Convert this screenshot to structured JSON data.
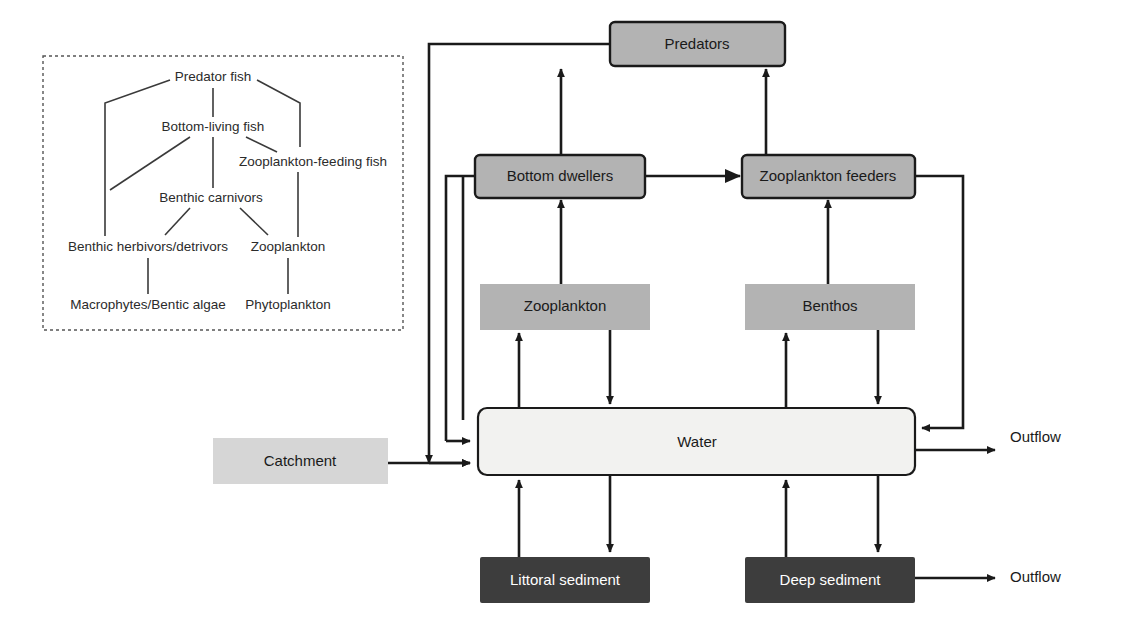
{
  "diagram": {
    "colors": {
      "box_mid_gray": "#b3b3b3",
      "box_light_gray": "#d6d6d6",
      "box_dark_gray": "#3d3d3d",
      "box_water_fill": "#f2f2f0",
      "stroke": "#1a1a1a",
      "inset_border": "#555555",
      "text_dark": "#1a1a1a",
      "text_light": "#ffffff"
    },
    "boxes": [
      {
        "id": "predators",
        "label": "Predators",
        "style": "mid-gray-bordered"
      },
      {
        "id": "bottom-dwellers",
        "label": "Bottom dwellers",
        "style": "mid-gray-bordered"
      },
      {
        "id": "zooplankton-feeders",
        "label": "Zooplankton feeders",
        "style": "mid-gray-bordered"
      },
      {
        "id": "zooplankton",
        "label": "Zooplankton",
        "style": "mid-gray-plain"
      },
      {
        "id": "benthos",
        "label": "Benthos",
        "style": "mid-gray-plain"
      },
      {
        "id": "water",
        "label": "Water",
        "style": "water"
      },
      {
        "id": "catchment",
        "label": "Catchment",
        "style": "light-gray-plain"
      },
      {
        "id": "littoral-sediment",
        "label": "Littoral sediment",
        "style": "dark-gray"
      },
      {
        "id": "deep-sediment",
        "label": "Deep sediment",
        "style": "dark-gray"
      }
    ],
    "outflows": [
      {
        "id": "outflow-water",
        "label": "Outflow",
        "source": "water"
      },
      {
        "id": "outflow-sediment",
        "label": "Outflow",
        "source": "deep-sediment"
      }
    ],
    "flows": [
      {
        "from": "bottom-dwellers",
        "to": "predators",
        "arrow": true
      },
      {
        "from": "zooplankton-feeders",
        "to": "predators",
        "arrow": true
      },
      {
        "from": "bottom-dwellers",
        "to": "zooplankton-feeders",
        "arrow": true
      },
      {
        "from": "zooplankton",
        "to": "bottom-dwellers",
        "arrow": true
      },
      {
        "from": "benthos",
        "to": "zooplankton-feeders",
        "arrow": true
      },
      {
        "from": "water",
        "to": "zooplankton",
        "arrow": true
      },
      {
        "from": "zooplankton",
        "to": "water",
        "arrow": true
      },
      {
        "from": "water",
        "to": "benthos",
        "arrow": true
      },
      {
        "from": "benthos",
        "to": "water",
        "arrow": true
      },
      {
        "from": "predators",
        "to": "water",
        "arrow": true
      },
      {
        "from": "bottom-dwellers",
        "to": "water",
        "arrow": true
      },
      {
        "from": "zooplankton-feeders",
        "to": "water",
        "arrow": true
      },
      {
        "from": "catchment",
        "to": "water",
        "arrow": true
      },
      {
        "from": "littoral-sediment",
        "to": "water",
        "arrow": true
      },
      {
        "from": "water",
        "to": "littoral-sediment",
        "arrow": true
      },
      {
        "from": "deep-sediment",
        "to": "water",
        "arrow": true
      },
      {
        "from": "water",
        "to": "deep-sediment",
        "arrow": true
      },
      {
        "from": "water",
        "to": "outflow-water",
        "arrow": true
      },
      {
        "from": "deep-sediment",
        "to": "outflow-sediment",
        "arrow": true
      }
    ]
  },
  "inset": {
    "title": "Food web inset",
    "nodes": [
      {
        "id": "predator-fish",
        "label": "Predator fish"
      },
      {
        "id": "bottom-living-fish",
        "label": "Bottom-living fish"
      },
      {
        "id": "zooplankton-feeding-fish",
        "label": "Zooplankton-feeding fish"
      },
      {
        "id": "benthic-carnivors",
        "label": "Benthic carnivors"
      },
      {
        "id": "benthic-herbivors-detrivors",
        "label": "Benthic herbivors/detrivors"
      },
      {
        "id": "zooplankton",
        "label": "Zooplankton"
      },
      {
        "id": "macrophytes-bentic-algae",
        "label": "Macrophytes/Bentic algae"
      },
      {
        "id": "phytoplankton",
        "label": "Phytoplankton"
      }
    ],
    "links": [
      {
        "from": "predator-fish",
        "to": "bottom-living-fish"
      },
      {
        "from": "predator-fish",
        "to": "zooplankton-feeding-fish"
      },
      {
        "from": "predator-fish",
        "to": "benthic-herbivors-detrivors"
      },
      {
        "from": "bottom-living-fish",
        "to": "benthic-carnivors"
      },
      {
        "from": "bottom-living-fish",
        "to": "benthic-herbivors-detrivors"
      },
      {
        "from": "bottom-living-fish",
        "to": "zooplankton-feeding-fish"
      },
      {
        "from": "zooplankton-feeding-fish",
        "to": "zooplankton"
      },
      {
        "from": "benthic-carnivors",
        "to": "benthic-herbivors-detrivors"
      },
      {
        "from": "benthic-carnivors",
        "to": "zooplankton"
      },
      {
        "from": "benthic-herbivors-detrivors",
        "to": "macrophytes-bentic-algae"
      },
      {
        "from": "zooplankton",
        "to": "phytoplankton"
      }
    ]
  }
}
